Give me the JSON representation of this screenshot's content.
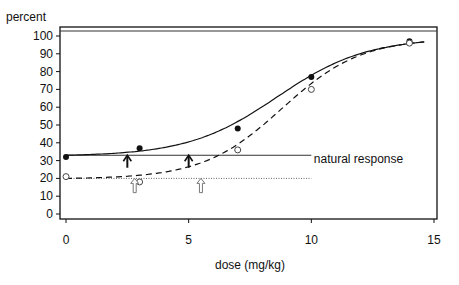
{
  "chart_data": {
    "type": "line",
    "title": "",
    "xlabel": "dose (mg/kg)",
    "ylabel": "percent",
    "xlim": [
      0,
      15
    ],
    "ylim": [
      0,
      100
    ],
    "x_ticks": [
      0,
      5,
      10,
      15
    ],
    "y_ticks": [
      0,
      10,
      20,
      30,
      40,
      50,
      60,
      70,
      80,
      90,
      100
    ],
    "grid": false,
    "series": [
      {
        "name": "observed (filled)",
        "marker": "filled-circle",
        "points": [
          [
            0,
            32
          ],
          [
            3,
            37
          ],
          [
            7,
            48
          ],
          [
            10,
            77
          ],
          [
            14,
            97
          ]
        ]
      },
      {
        "name": "observed (open)",
        "marker": "open-circle",
        "points": [
          [
            0,
            21
          ],
          [
            3,
            18
          ],
          [
            7,
            36
          ],
          [
            10,
            70
          ],
          [
            14,
            96
          ]
        ]
      },
      {
        "name": "fitted curve (solid)",
        "line": "solid",
        "background": 33,
        "ed50": 8.6,
        "slope": 0.55
      },
      {
        "name": "fitted curve (dashed)",
        "line": "dashed",
        "background": 20,
        "ed50": 8.8,
        "slope": 0.62
      }
    ],
    "reference_lines": [
      {
        "name": "natural response (solid)",
        "y": 33,
        "x_range": [
          0,
          10
        ],
        "style": "solid"
      },
      {
        "name": "natural response (dotted)",
        "y": 20,
        "x_range": [
          0,
          10
        ],
        "style": "dotted"
      },
      {
        "name": "upper reference",
        "y": 101,
        "x_range": [
          0,
          15
        ],
        "style": "solid"
      }
    ],
    "annotations": [
      {
        "text": "natural response",
        "x": 10.1,
        "y": 30
      },
      {
        "type": "solid-arrow",
        "x": 2.5,
        "y_from": 26,
        "y_to": 33
      },
      {
        "type": "solid-arrow",
        "x": 5.0,
        "y_from": 26,
        "y_to": 33
      },
      {
        "type": "hollow-arrow",
        "x": 2.8,
        "y_from": 12,
        "y_to": 20
      },
      {
        "type": "hollow-arrow",
        "x": 5.5,
        "y_from": 12,
        "y_to": 20
      }
    ]
  }
}
